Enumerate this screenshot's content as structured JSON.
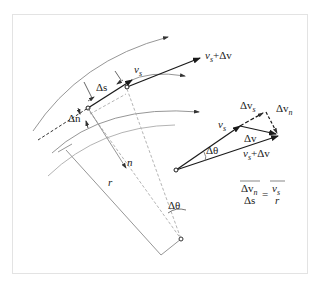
{
  "figure": {
    "labels": {
      "delta_n": "Δn",
      "delta_s": "Δs",
      "v_s": "v",
      "v_s_sub": "s",
      "v_s_plus_dv": "v",
      "v_s_plus_dv_sub": "s",
      "v_s_plus_dv_tail": "+Δv",
      "n": "n",
      "r": "r",
      "delta_theta": "Δθ"
    },
    "vector_triangle": {
      "delta_v_s": "Δv",
      "delta_v_s_sub": "s",
      "delta_v_n": "Δv",
      "delta_v_n_sub": "n",
      "v_s": "v",
      "v_s_sub": "s",
      "delta_v": "Δv",
      "delta_theta": "Δθ",
      "v_s_plus_dv": "v",
      "v_s_plus_dv_sub": "s",
      "v_s_plus_dv_tail": "+Δv"
    },
    "formula": {
      "lhs_num": "Δv",
      "lhs_num_sub": "n",
      "lhs_den": "Δs",
      "equals": "=",
      "rhs_num": "v",
      "rhs_num_sub": "s",
      "rhs_den": "r"
    },
    "colors": {
      "stroke_dark": "#1a1a1a",
      "stroke_light": "#9a9a9a",
      "dashed": "#b5b5b5",
      "frame": "#e3e3e3"
    }
  }
}
